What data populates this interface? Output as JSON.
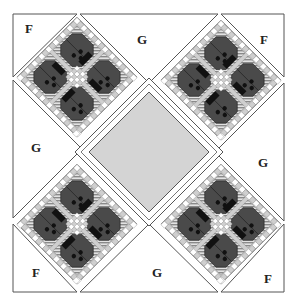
{
  "diagram": {
    "piece_labels": {
      "corner": "F",
      "edge": "G"
    },
    "labels": [
      {
        "id": "f-top-left",
        "text": "F"
      },
      {
        "id": "g-top",
        "text": "G"
      },
      {
        "id": "f-top-right",
        "text": "F"
      },
      {
        "id": "g-left",
        "text": "G"
      },
      {
        "id": "g-right",
        "text": "G"
      },
      {
        "id": "f-bottom-left",
        "text": "F"
      },
      {
        "id": "g-bottom",
        "text": "G"
      },
      {
        "id": "f-bottom-right",
        "text": "F"
      }
    ],
    "blocks": [
      {
        "id": "block-top-left",
        "motif": "ladybug",
        "count": 4
      },
      {
        "id": "block-top-right",
        "motif": "ladybug",
        "count": 4
      },
      {
        "id": "block-bottom-left",
        "motif": "ladybug",
        "count": 4
      },
      {
        "id": "block-bottom-right",
        "motif": "ladybug",
        "count": 4
      }
    ],
    "center": {
      "id": "center-square",
      "motif": "plain"
    },
    "colors": {
      "background": "#ffffff",
      "outline": "#555555",
      "ladybug_body": "#4a4a4a",
      "ladybug_dark": "#111111",
      "sashing_light": "#cfcfcf",
      "stripe": "#9a9a9a",
      "center_fill": "#d4d4d4",
      "checker_white": "#ffffff"
    }
  }
}
